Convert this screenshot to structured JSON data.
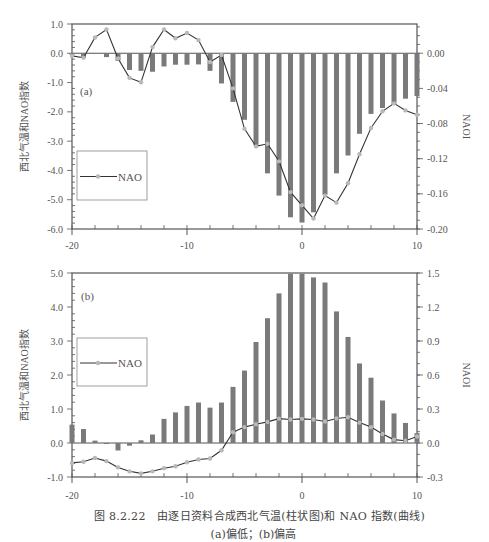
{
  "figure": {
    "caption_line1": "图 8.2.22　由逐日资料合成西北气温(柱状图)和 NAO 指数(曲线)",
    "caption_line2": "(a)偏低；(b)偏高"
  },
  "colors": {
    "bar": "#7a7a7a",
    "line": "#333333",
    "marker": "#b8b8b8",
    "axis": "#555555",
    "legend_border": "#888888"
  },
  "chart_data": [
    {
      "id": "a",
      "type": "bar+line",
      "panel_label": "(a)",
      "title": "",
      "xlabel": "",
      "ylabel": "西北气温和NAO指数",
      "y2label": "NAOI",
      "x": [
        -20,
        -19,
        -18,
        -17,
        -16,
        -15,
        -14,
        -13,
        -12,
        -11,
        -10,
        -9,
        -8,
        -7,
        -6,
        -5,
        -4,
        -3,
        -2,
        -1,
        0,
        1,
        2,
        3,
        4,
        5,
        6,
        7,
        8,
        9,
        10
      ],
      "xlim": [
        -20,
        10
      ],
      "xticks": [
        -20,
        -10,
        0,
        10
      ],
      "xtick_labels": [
        "-20",
        "-10",
        "0",
        "10"
      ],
      "ylim": [
        -6.0,
        1.0
      ],
      "yticks": [
        1.0,
        0.0,
        -1.0,
        -2.0,
        -3.0,
        -4.0,
        -5.0,
        -6.0
      ],
      "ytick_labels": [
        "1.0",
        "0.0",
        "-1.0",
        "-2.0",
        "-3.0",
        "-4.0",
        "-5.0",
        "-6.0"
      ],
      "y2lim": [
        -0.2,
        0.0333
      ],
      "y2ticks": [
        0.0,
        -0.04,
        -0.08,
        -0.12,
        -0.16,
        -0.2
      ],
      "y2tick_labels": [
        "0.00",
        "-0.04",
        "-0.08",
        "-0.12",
        "-0.16",
        "-0.20"
      ],
      "grid": false,
      "legend": {
        "position": "lower-left-inside",
        "entries": [
          "NAO"
        ]
      },
      "series": [
        {
          "name": "西北气温",
          "kind": "bar",
          "axis": "left",
          "values": [
            -0.05,
            -0.15,
            0.0,
            -0.13,
            -0.26,
            -0.57,
            -0.6,
            -0.63,
            -0.45,
            -0.39,
            -0.39,
            -0.38,
            -0.6,
            -1.03,
            -1.66,
            -2.27,
            -3.15,
            -4.1,
            -4.86,
            -5.6,
            -5.78,
            -5.43,
            -4.83,
            -4.1,
            -3.49,
            -2.75,
            -2.07,
            -1.87,
            -1.72,
            -1.55,
            -1.46
          ]
        },
        {
          "name": "NAO",
          "kind": "line",
          "axis": "right",
          "values": [
            -0.003,
            -0.005,
            0.018,
            0.027,
            -0.006,
            -0.028,
            -0.033,
            0.007,
            0.027,
            0.017,
            0.023,
            0.015,
            -0.01,
            -0.002,
            -0.04,
            -0.086,
            -0.106,
            -0.103,
            -0.123,
            -0.158,
            -0.173,
            -0.188,
            -0.162,
            -0.17,
            -0.148,
            -0.115,
            -0.085,
            -0.066,
            -0.057,
            -0.065,
            -0.07
          ]
        }
      ]
    },
    {
      "id": "b",
      "type": "bar+line",
      "panel_label": "(b)",
      "title": "",
      "xlabel": "",
      "ylabel": "西北气温和NAO指数",
      "y2label": "NAOI",
      "x": [
        -20,
        -19,
        -18,
        -17,
        -16,
        -15,
        -14,
        -13,
        -12,
        -11,
        -10,
        -9,
        -8,
        -7,
        -6,
        -5,
        -4,
        -3,
        -2,
        -1,
        0,
        1,
        2,
        3,
        4,
        5,
        6,
        7,
        8,
        9,
        10
      ],
      "xlim": [
        -20,
        10
      ],
      "xticks": [
        -20,
        -10,
        0,
        10
      ],
      "xtick_labels": [
        "-20",
        "-10",
        "0",
        "10"
      ],
      "ylim": [
        -1.0,
        5.0
      ],
      "yticks": [
        5.0,
        4.0,
        3.0,
        2.0,
        1.0,
        0.0,
        -1.0
      ],
      "ytick_labels": [
        "5.0",
        "4.0",
        "3.0",
        "2.0",
        "1.0",
        "0.0",
        "-1.0"
      ],
      "y2lim": [
        -0.3,
        1.5
      ],
      "y2ticks": [
        1.5,
        1.2,
        0.9,
        0.6,
        0.3,
        0.0,
        -0.3
      ],
      "y2tick_labels": [
        "1.5",
        "1.2",
        "0.9",
        "0.6",
        "0.3",
        "0.0",
        "-0.3"
      ],
      "grid": false,
      "legend": {
        "position": "upper-left-inside",
        "entries": [
          "NAO"
        ]
      },
      "series": [
        {
          "name": "西北气温",
          "kind": "bar",
          "axis": "left",
          "values": [
            0.54,
            0.41,
            0.07,
            -0.03,
            -0.22,
            -0.08,
            0.08,
            0.25,
            0.71,
            0.9,
            1.09,
            1.19,
            1.04,
            1.19,
            1.65,
            2.13,
            2.97,
            3.67,
            4.4,
            4.98,
            4.98,
            4.87,
            4.72,
            3.87,
            3.12,
            2.34,
            1.92,
            1.25,
            0.87,
            0.59,
            0.29
          ]
        },
        {
          "name": "NAO",
          "kind": "line",
          "axis": "right",
          "values": [
            -0.176,
            -0.165,
            -0.132,
            -0.16,
            -0.215,
            -0.25,
            -0.268,
            -0.25,
            -0.222,
            -0.205,
            -0.17,
            -0.146,
            -0.137,
            -0.064,
            0.095,
            0.14,
            0.165,
            0.186,
            0.215,
            0.207,
            0.213,
            0.207,
            0.19,
            0.216,
            0.228,
            0.18,
            0.14,
            0.08,
            0.03,
            0.02,
            0.057
          ]
        }
      ]
    }
  ]
}
